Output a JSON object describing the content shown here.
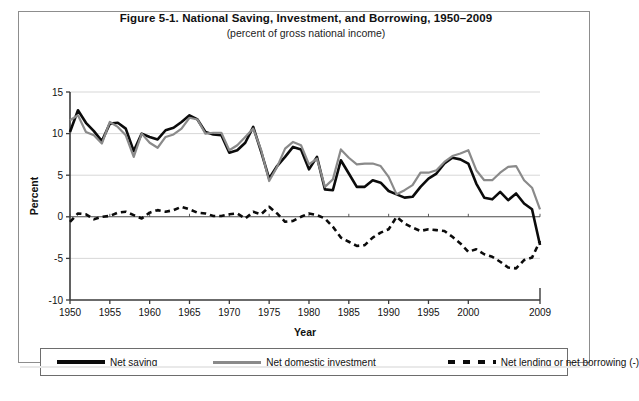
{
  "figure": {
    "title": "Figure 5-1. National Saving, Investment, and Borrowing, 1950–2009",
    "subtitle": "(percent of gross national income)"
  },
  "legend": {
    "items": [
      {
        "label": "Net saving",
        "style": "solid-black",
        "color": "#0b0b0b"
      },
      {
        "label": "Net domestic investment",
        "style": "solid-gray",
        "color": "#8a8a8a"
      },
      {
        "label": "Net lending or net borrowing (-)",
        "style": "dashed-black",
        "color": "#0b0b0b"
      }
    ]
  },
  "chart_data": {
    "type": "line",
    "title": "Figure 5-1. National Saving, Investment, and Borrowing, 1950–2009",
    "subtitle": "(percent of gross national income)",
    "xlabel": "Year",
    "ylabel": "Percent",
    "xlim": [
      1950,
      2009
    ],
    "ylim": [
      -10,
      15
    ],
    "yticks": [
      -10,
      -5,
      0,
      5,
      10,
      15
    ],
    "ytick_labels": [
      "-10",
      "-5",
      "0",
      "5",
      "10",
      "15"
    ],
    "xticks": [
      1950,
      1955,
      1960,
      1965,
      1970,
      1975,
      1980,
      1985,
      1990,
      1995,
      2000,
      2009
    ],
    "xtick_labels": [
      "1950",
      "1955",
      "1960",
      "1965",
      "1970",
      "1975",
      "1980",
      "1985",
      "1990",
      "1995",
      "2000",
      "2009"
    ],
    "grid": "horizontal",
    "legend_position": "bottom",
    "x": [
      1950,
      1951,
      1952,
      1953,
      1954,
      1955,
      1956,
      1957,
      1958,
      1959,
      1960,
      1961,
      1962,
      1963,
      1964,
      1965,
      1966,
      1967,
      1968,
      1969,
      1970,
      1971,
      1972,
      1973,
      1974,
      1975,
      1976,
      1977,
      1978,
      1979,
      1980,
      1981,
      1982,
      1983,
      1984,
      1985,
      1986,
      1987,
      1988,
      1989,
      1990,
      1991,
      1992,
      1993,
      1994,
      1995,
      1996,
      1997,
      1998,
      1999,
      2000,
      2001,
      2002,
      2003,
      2004,
      2005,
      2006,
      2007,
      2008,
      2009
    ],
    "series": [
      {
        "name": "Net saving",
        "color": "#0b0b0b",
        "style": "solid",
        "width": 2.6,
        "values": [
          10.2,
          12.8,
          11.3,
          10.3,
          9.1,
          11.2,
          11.3,
          10.6,
          7.9,
          10.0,
          9.6,
          9.3,
          10.4,
          10.7,
          11.4,
          12.2,
          11.7,
          10.2,
          9.9,
          9.8,
          7.7,
          8.0,
          8.9,
          10.8,
          7.8,
          4.6,
          6.1,
          7.2,
          8.4,
          8.1,
          5.7,
          7.2,
          3.3,
          3.2,
          6.8,
          5.2,
          3.6,
          3.6,
          4.4,
          4.1,
          3.1,
          2.7,
          2.3,
          2.4,
          3.6,
          4.6,
          5.2,
          6.4,
          7.1,
          6.9,
          6.4,
          4.0,
          2.3,
          2.1,
          3.0,
          2.0,
          2.8,
          1.6,
          0.9,
          -3.4
        ]
      },
      {
        "name": "Net domestic investment",
        "color": "#8a8a8a",
        "style": "solid",
        "width": 2.2,
        "values": [
          11.6,
          12.2,
          10.2,
          9.8,
          8.8,
          11.4,
          10.8,
          9.8,
          7.2,
          10.0,
          8.9,
          8.3,
          9.6,
          9.9,
          10.6,
          11.9,
          11.7,
          10.0,
          10.1,
          10.1,
          8.0,
          8.6,
          9.6,
          10.6,
          8.0,
          4.3,
          6.0,
          8.2,
          9.0,
          8.6,
          6.3,
          7.0,
          3.6,
          4.5,
          8.1,
          7.1,
          6.3,
          6.4,
          6.4,
          6.1,
          4.8,
          2.7,
          3.2,
          3.8,
          5.3,
          5.3,
          5.6,
          6.6,
          7.3,
          7.6,
          8.0,
          5.6,
          4.4,
          4.4,
          5.3,
          6.0,
          6.1,
          4.4,
          3.5,
          0.9
        ]
      },
      {
        "name": "Net lending or net borrowing (-)",
        "color": "#0b0b0b",
        "style": "dashed",
        "width": 2.6,
        "values": [
          -0.6,
          0.4,
          0.3,
          -0.3,
          0.0,
          0.1,
          0.5,
          0.6,
          0.2,
          -0.2,
          0.5,
          0.8,
          0.6,
          0.8,
          1.2,
          0.9,
          0.5,
          0.4,
          0.1,
          0.1,
          0.3,
          0.4,
          -0.2,
          0.6,
          0.3,
          1.2,
          0.4,
          -0.6,
          -0.5,
          0.0,
          0.4,
          0.2,
          -0.2,
          -1.2,
          -2.5,
          -3.0,
          -3.5,
          -3.4,
          -2.5,
          -1.9,
          -1.5,
          0.0,
          -0.8,
          -1.3,
          -1.7,
          -1.5,
          -1.6,
          -1.7,
          -2.4,
          -3.2,
          -4.2,
          -3.9,
          -4.5,
          -4.8,
          -5.4,
          -6.1,
          -6.2,
          -5.2,
          -4.9,
          -2.9
        ]
      }
    ]
  }
}
